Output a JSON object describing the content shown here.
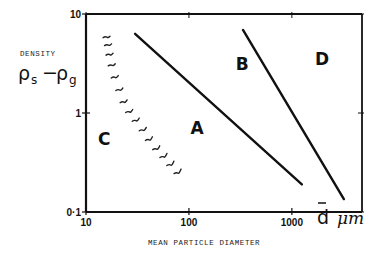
{
  "chart_data": {
    "type": "line",
    "title": "",
    "xlabel": "MEAN PARTICLE DIAMETER",
    "xunit_symbol": "d",
    "xunit": "μm",
    "ylabel": "DENSITY",
    "ylabel_expr": {
      "rho": "ρ",
      "sub1": "s",
      "minus": "−",
      "sub2": "g"
    },
    "xscale": "log",
    "yscale": "log",
    "xlim": [
      10,
      4800
    ],
    "ylim": [
      0.1,
      10
    ],
    "xticks": [
      10,
      100,
      1000
    ],
    "xtick_labels": [
      "10",
      "100",
      "1000"
    ],
    "yticks": [
      0.1,
      1,
      10
    ],
    "ytick_labels": [
      "0·1",
      "1",
      "10"
    ],
    "grid": false,
    "series": [
      {
        "name": "A-B boundary",
        "style": "solid",
        "x": [
          30,
          1250
        ],
        "y": [
          6.3,
          0.19
        ]
      },
      {
        "name": "B-D boundary",
        "style": "solid",
        "x": [
          335,
          3200
        ],
        "y": [
          6.9,
          0.135
        ]
      },
      {
        "name": "C boundary",
        "style": "hatched",
        "x": [
          16,
          16.5,
          17,
          17.8,
          19,
          21,
          23,
          26,
          30,
          35,
          40,
          47,
          55,
          64,
          75
        ],
        "y": [
          5.5,
          4.6,
          3.7,
          2.9,
          2.2,
          1.65,
          1.25,
          1.0,
          0.82,
          0.66,
          0.53,
          0.43,
          0.36,
          0.3,
          0.25
        ]
      }
    ],
    "regions": [
      {
        "label": "A",
        "x": 120,
        "y": 0.7
      },
      {
        "label": "B",
        "x": 330,
        "y": 3.1
      },
      {
        "label": "C",
        "x": 15,
        "y": 0.55
      },
      {
        "label": "D",
        "x": 1970,
        "y": 3.5
      }
    ]
  }
}
